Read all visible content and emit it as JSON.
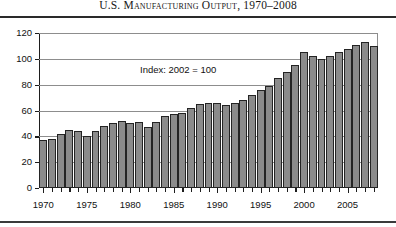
{
  "chart_data": {
    "type": "bar",
    "title": "U.S. Manufacturing Output, 1970–2008",
    "annotation": "Index: 2002 = 100",
    "xlabel": "",
    "ylabel": "",
    "ylim": [
      0,
      120
    ],
    "ytick_labels": [
      "0",
      "20",
      "40",
      "60",
      "80",
      "100",
      "120"
    ],
    "ytick_values": [
      0,
      20,
      40,
      60,
      80,
      100,
      120
    ],
    "xtick_labels": [
      "1970",
      "1975",
      "1980",
      "1985",
      "1990",
      "1995",
      "2000",
      "2005"
    ],
    "xtick_values": [
      1970,
      1975,
      1980,
      1985,
      1990,
      1995,
      2000,
      2005
    ],
    "grid": true,
    "legend": "none",
    "bar_color": "#8b8b8b",
    "bar_edge_color": "#242424",
    "categories": [
      "1970",
      "1971",
      "1972",
      "1973",
      "1974",
      "1975",
      "1976",
      "1977",
      "1978",
      "1979",
      "1980",
      "1981",
      "1982",
      "1983",
      "1984",
      "1985",
      "1986",
      "1987",
      "1988",
      "1989",
      "1990",
      "1991",
      "1992",
      "1993",
      "1994",
      "1995",
      "1996",
      "1997",
      "1998",
      "1999",
      "2000",
      "2001",
      "2002",
      "2003",
      "2004",
      "2005",
      "2006",
      "2007",
      "2008"
    ],
    "values": [
      37,
      38,
      42,
      45,
      44,
      40,
      44,
      48,
      50,
      52,
      50,
      51,
      47,
      51,
      56,
      57,
      58,
      62,
      65,
      66,
      66,
      64,
      66,
      68,
      72,
      76,
      79,
      85,
      90,
      95,
      105,
      102,
      100,
      102,
      105,
      108,
      111,
      113,
      110
    ],
    "series_name": "U.S. Manufacturing Output Index"
  }
}
